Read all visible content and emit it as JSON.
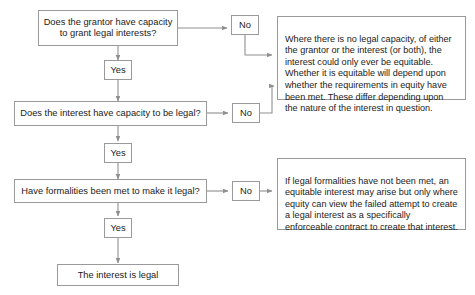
{
  "diagram": {
    "line_color": "#8f8f8f",
    "box_border_color": "#9a9a9a",
    "text_color": "#1b1b1b",
    "background": "#ffffff"
  },
  "nodes": {
    "question_1": "Does the grantor have capacity\nto grant legal interests?",
    "question_2": "Does the interest have capacity to be legal?",
    "question_3": "Have formalities been met to make it legal?",
    "terminal": "The interest is legal"
  },
  "decisions": {
    "no_1": "No",
    "no_2": "No",
    "no_3": "No",
    "yes_1": "Yes",
    "yes_2": "Yes",
    "yes_3": "Yes"
  },
  "notes": {
    "note_capacity": "Where there is no legal capacity, of either the grantor or the interest (or both), the interest could only ever be equitable. Whether it is equitable will depend upon whether the requirements in equity have been met. These differ depending upon the nature of the interest in question.",
    "note_formalities": "If legal formalities have not been met, an equitable interest may arise but only where equity can view the failed attempt to create a legal interest as a specifically enforceable contract to create that interest."
  }
}
